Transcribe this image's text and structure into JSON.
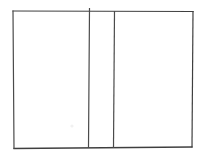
{
  "canvas": {
    "width": 207,
    "height": 159,
    "background_color": "#ffffff",
    "title": "Line drawing of a rectangle divided into three vertical panels"
  },
  "style": {
    "stroke_color": "#3f3f3f",
    "stroke_color_light": "#6a6a6a",
    "stroke_width": 1.2,
    "fill": "none"
  },
  "figure": {
    "name": "three-panel-rectangle",
    "description": "Open book / trifold panel outline",
    "outer_rectangle": {
      "label": "outer-frame",
      "x": 13,
      "y": 11,
      "width": 180,
      "height": 137,
      "right": 193,
      "bottom": 148
    },
    "edges": [
      {
        "label": "top-edge",
        "x1": 13,
        "y1": 11,
        "x2": 193,
        "y2": 11.5
      },
      {
        "label": "right-edge",
        "x1": 193,
        "y1": 11.5,
        "x2": 192,
        "y2": 147
      },
      {
        "label": "bottom-edge",
        "x1": 192,
        "y1": 147,
        "x2": 14,
        "y2": 148.5
      },
      {
        "label": "left-edge",
        "x1": 14,
        "y1": 148.5,
        "x2": 13,
        "y2": 11
      }
    ],
    "dividers": [
      {
        "label": "divider-left",
        "x1": 89.5,
        "y1": 8.5,
        "x2": 88.5,
        "y2": 147.5,
        "overshoot_top": 3
      },
      {
        "label": "divider-right",
        "x1": 114.5,
        "y1": 11.5,
        "x2": 113.5,
        "y2": 147.5,
        "overshoot_top": 0
      }
    ],
    "panels": [
      {
        "label": "left-panel",
        "x": 13,
        "y": 11,
        "width": 76,
        "height": 137,
        "fill": "#ffffff"
      },
      {
        "label": "middle-panel",
        "x": 89,
        "y": 11,
        "width": 25,
        "height": 137,
        "fill": "#ffffff"
      },
      {
        "label": "right-panel",
        "x": 114,
        "y": 11,
        "width": 79,
        "height": 137,
        "fill": "#ffffff"
      }
    ],
    "marks": [
      {
        "label": "faint-speck",
        "x": 72,
        "y": 126,
        "radius": 1.6,
        "color": "#f1f1f1"
      }
    ]
  }
}
